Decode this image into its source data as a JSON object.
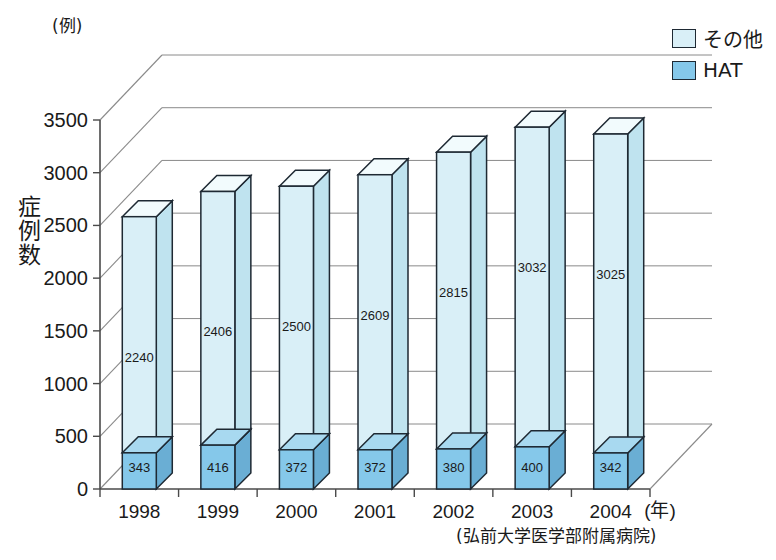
{
  "chart_data": {
    "type": "bar",
    "subtype": "stacked-3d-column",
    "title": "",
    "xlabel": "年",
    "ylabel": "症例数",
    "yunit": "(例)",
    "categories": [
      "1998",
      "1999",
      "2000",
      "2001",
      "2002",
      "2003",
      "2004"
    ],
    "series": [
      {
        "name": "HAT",
        "color": "#85c8ea",
        "values": [
          343,
          416,
          372,
          372,
          380,
          400,
          342
        ]
      },
      {
        "name": "その他",
        "color": "#d9eff7",
        "values": [
          2240,
          2406,
          2500,
          2609,
          2815,
          3032,
          3025
        ]
      }
    ],
    "totals": [
      2583,
      2822,
      2872,
      2981,
      3195,
      3432,
      3367
    ],
    "ylim": [
      0,
      3500
    ],
    "yticks": [
      0,
      500,
      1000,
      1500,
      2000,
      2500,
      3000,
      3500
    ],
    "ytick_labels": [
      "0",
      "500",
      "1000",
      "1500",
      "2000",
      "2500",
      "3000",
      "3500"
    ],
    "grid": true,
    "legend_position": "top-right",
    "source": "(弘前大学医学部附属病院)"
  },
  "axis": {
    "y_unit_label": "(例)",
    "y_title": "症例数",
    "x_unit_label": "(年)"
  },
  "legend": {
    "items": [
      {
        "label": "その他",
        "color": "#d9eff7"
      },
      {
        "label": "HAT",
        "color": "#85c8ea"
      }
    ]
  },
  "source_note": "(弘前大学医学部附属病院)"
}
